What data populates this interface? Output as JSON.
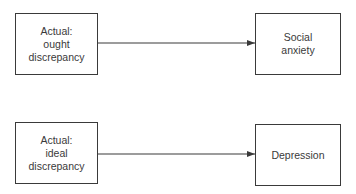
{
  "diagram": {
    "colors": {
      "stroke": "#3a3a3a",
      "text": "#3a3a3a",
      "background": "#ffffff"
    },
    "nodes": [
      {
        "id": "actual-ought",
        "lines": [
          "Actual:",
          "ought",
          "discrepancy"
        ]
      },
      {
        "id": "social-anxiety",
        "lines": [
          "Social",
          "anxiety"
        ]
      },
      {
        "id": "actual-ideal",
        "lines": [
          "Actual:",
          "ideal",
          "discrepancy"
        ]
      },
      {
        "id": "depression",
        "lines": [
          "Depression"
        ]
      }
    ],
    "edges": [
      {
        "from": "actual-ought",
        "to": "social-anxiety"
      },
      {
        "from": "actual-ideal",
        "to": "depression"
      }
    ]
  }
}
